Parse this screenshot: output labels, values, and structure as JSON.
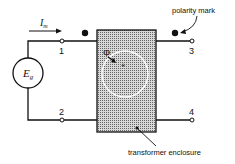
{
  "diagram": {
    "current_label": "I",
    "current_subscript": "m",
    "source_label": "E",
    "source_subscript": "g",
    "flux_label": "Φ",
    "flux_plus": "+",
    "terminals": [
      "1",
      "2",
      "3",
      "4"
    ],
    "annotations": {
      "polarity_mark": "polarity mark",
      "enclosure": "transformer enclosure"
    },
    "colors": {
      "line": "#111111",
      "enclosure_fill": "#b5b5b5",
      "background": "#ffffff"
    }
  }
}
